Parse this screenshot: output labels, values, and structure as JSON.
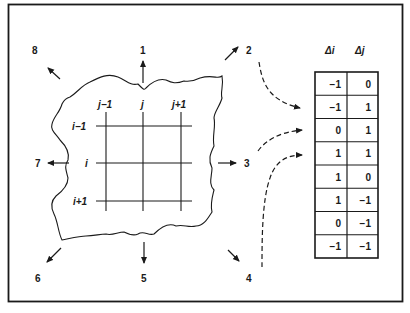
{
  "figure": {
    "direction_labels": [
      "1",
      "2",
      "3",
      "4",
      "5",
      "6",
      "7",
      "8"
    ],
    "grid": {
      "column_labels": [
        "j−1",
        "j",
        "j+1"
      ],
      "row_labels": [
        "i−1",
        "i",
        "i+1"
      ]
    },
    "table": {
      "headers": [
        "Δi",
        "Δj"
      ],
      "rows": [
        [
          "−1",
          "0"
        ],
        [
          "−1",
          "1"
        ],
        [
          "0",
          "1"
        ],
        [
          "1",
          "1"
        ],
        [
          "1",
          "0"
        ],
        [
          "1",
          "−1"
        ],
        [
          "0",
          "−1"
        ],
        [
          "−1",
          "−1"
        ]
      ]
    }
  },
  "colors": {
    "ink": "#1a1a1a",
    "background": "#ffffff"
  }
}
